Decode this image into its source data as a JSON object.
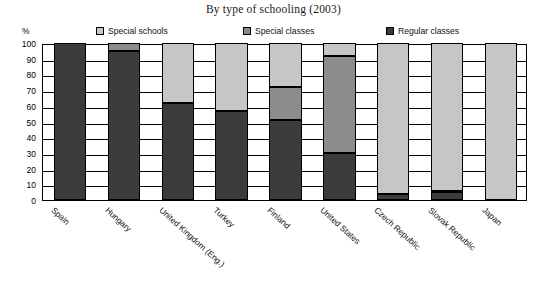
{
  "chart_data": {
    "type": "bar",
    "title": "By type of schooling (2003)",
    "xlabel": "",
    "ylabel": "%",
    "ylim": [
      0,
      100
    ],
    "ytick_labels": [
      "100",
      "90",
      "80",
      "70",
      "60",
      "50",
      "40",
      "30",
      "20",
      "10",
      "0"
    ],
    "grid": true,
    "stacked": true,
    "legend_position": "top",
    "categories": [
      "Spain",
      "Hungary",
      "United Kingdom (Eng.)",
      "Turkey",
      "Finland",
      "United States",
      "Czech Republic",
      "Slovak Republic",
      "Japan"
    ],
    "series": [
      {
        "name": "Special schools",
        "color": "#c6c6c6",
        "values": [
          0,
          0,
          38,
          43,
          28,
          8,
          96,
          94,
          100
        ]
      },
      {
        "name": "Special classes",
        "color": "#8c8c8c",
        "values": [
          0,
          5,
          0,
          0,
          21,
          62,
          0,
          1,
          0
        ]
      },
      {
        "name": "Regular classes",
        "color": "#3c3c3c",
        "values": [
          100,
          95,
          62,
          57,
          51,
          30,
          4,
          5,
          0
        ]
      }
    ]
  },
  "legend": {
    "items": [
      {
        "label": "Special schools",
        "swatch": "light"
      },
      {
        "label": "Special classes",
        "swatch": "mid"
      },
      {
        "label": "Regular classes",
        "swatch": "dark"
      }
    ]
  },
  "axis": {
    "unit_label": "%"
  }
}
